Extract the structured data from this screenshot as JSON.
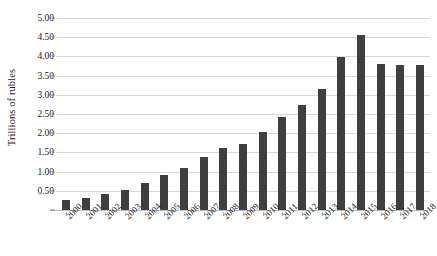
{
  "chart_data": {
    "type": "bar",
    "title": "",
    "xlabel": "",
    "ylabel": "Trillions of rubles",
    "categories": [
      "2000",
      "2001",
      "2002",
      "2003",
      "2004",
      "2005",
      "2006",
      "2007",
      "2008",
      "2009",
      "2010",
      "2011",
      "2012",
      "2013",
      "2014",
      "2015",
      "2016",
      "2017",
      "2018"
    ],
    "values": [
      0.25,
      0.32,
      0.41,
      0.53,
      0.7,
      0.92,
      1.1,
      1.38,
      1.61,
      1.73,
      2.03,
      2.42,
      2.73,
      3.16,
      3.98,
      4.55,
      3.8,
      3.78,
      3.78
    ],
    "ylim": [
      0,
      5.0
    ],
    "ytick_labels": [
      "-",
      "0.50",
      "1.00",
      "1.50",
      "2.00",
      "2.50",
      "3.00",
      "3.50",
      "4.00",
      "4.50",
      "5.00"
    ],
    "ytick_values": [
      0,
      0.5,
      1.0,
      1.5,
      2.0,
      2.5,
      3.0,
      3.5,
      4.0,
      4.5,
      5.0
    ],
    "grid": true,
    "legend": false,
    "legend_position": "none",
    "series": [
      {
        "name": "Trillions of rubles",
        "color": "#3f3f3f",
        "values": [
          0.25,
          0.32,
          0.41,
          0.53,
          0.7,
          0.92,
          1.1,
          1.38,
          1.61,
          1.73,
          2.03,
          2.42,
          2.73,
          3.16,
          3.98,
          4.55,
          3.8,
          3.78,
          3.78
        ]
      }
    ]
  },
  "colors": {
    "bar": "#3f3f3f",
    "gridline": "#d9d9d9",
    "axis": "#bdbdbd",
    "text": "#1a1a1a",
    "background": "#ffffff"
  }
}
